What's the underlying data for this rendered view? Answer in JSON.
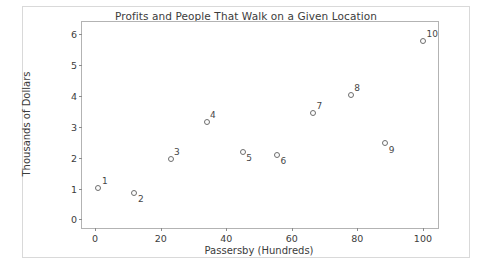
{
  "chart_data": {
    "type": "scatter",
    "title": "Profits and People That Walk on a Given Location",
    "xlabel": "Passersby (Hundreds)",
    "ylabel": "Thousands of Dollars",
    "xlim": [
      -4,
      104.6
    ],
    "ylim": [
      -0.28,
      6.4
    ],
    "xticks": [
      0,
      20,
      40,
      60,
      80,
      100
    ],
    "xtick_labels": [
      "0",
      "20",
      "40",
      "60",
      "80",
      "100"
    ],
    "yticks": [
      0,
      1,
      2,
      3,
      4,
      5,
      6
    ],
    "ytick_labels": [
      "0",
      "1",
      "2",
      "3",
      "4",
      "5",
      "6"
    ],
    "grid": false,
    "legend": null,
    "marker_style": "open-circle",
    "marker_edge_color": "#6e6e6e",
    "marker_face_color": "#fdfdfd",
    "axes_color": "#b3b3b3",
    "text_color": "#3c3c3c",
    "background": "#ffffff",
    "points": [
      {
        "label": "1",
        "x": 1,
        "y": 1.03,
        "label_pos": "above-right"
      },
      {
        "label": "2",
        "x": 12,
        "y": 0.87,
        "label_pos": "below-right"
      },
      {
        "label": "3",
        "x": 23,
        "y": 1.97,
        "label_pos": "above-right"
      },
      {
        "label": "4",
        "x": 34,
        "y": 3.15,
        "label_pos": "above-right"
      },
      {
        "label": "5",
        "x": 45,
        "y": 2.19,
        "label_pos": "below-right"
      },
      {
        "label": "6",
        "x": 55.5,
        "y": 2.1,
        "label_pos": "below-right"
      },
      {
        "label": "7",
        "x": 66.5,
        "y": 3.45,
        "label_pos": "above-right"
      },
      {
        "label": "8",
        "x": 78,
        "y": 4.04,
        "label_pos": "above-right"
      },
      {
        "label": "9",
        "x": 88.5,
        "y": 2.47,
        "label_pos": "below-right"
      },
      {
        "label": "10",
        "x": 100,
        "y": 5.8,
        "label_pos": "above-right"
      }
    ]
  }
}
